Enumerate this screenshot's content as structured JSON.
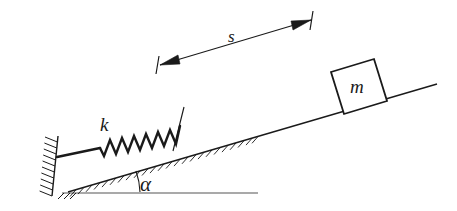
{
  "figure": {
    "background_color": "#ffffff",
    "ink_color": "#1a1a1a",
    "labels": {
      "spring_stiffness": "k",
      "block_mass": "m",
      "displacement": "s",
      "incline_angle": "α"
    },
    "elements": {
      "wall": "hatched-vertical-wall",
      "ground": "horizontal-baseline",
      "incline": "hatched-inclined-surface",
      "spring": "coil-spring",
      "block": "rectangular-block",
      "dimension": "double-headed-arrow"
    },
    "geometry": {
      "incline_angle_degrees": 17,
      "spring_coils": 11,
      "dimension_arrow_heads": 2
    }
  }
}
